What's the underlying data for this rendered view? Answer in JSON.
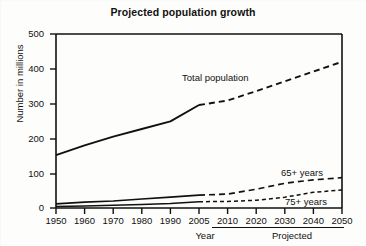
{
  "chart_data": {
    "type": "line",
    "title": "Projected population growth",
    "xlabel": "Year",
    "ylabel": "Number in millions",
    "xlim": [
      1950,
      2050
    ],
    "ylim": [
      0,
      500
    ],
    "grid": false,
    "legend_position": "inline-annotations",
    "xticks": [
      "1950",
      "1960",
      "1970",
      "1980",
      "1990",
      "2005",
      "2010",
      "2020",
      "2030",
      "2040",
      "2050"
    ],
    "xtick_values": [
      1950,
      1960,
      1970,
      1980,
      1990,
      2005,
      2010,
      2020,
      2030,
      2040,
      2050
    ],
    "yticks": [
      "0",
      "100",
      "200",
      "300",
      "400",
      "500"
    ],
    "ytick_values": [
      0,
      100,
      200,
      300,
      400,
      500
    ],
    "projected_from": 2005,
    "projected_note": "Projected",
    "series": [
      {
        "name": "Total population",
        "style_actual": "solid",
        "style_projected": "dashed",
        "x": [
          1950,
          1960,
          1970,
          1980,
          1990,
          2005,
          2010,
          2020,
          2030,
          2040,
          2050
        ],
        "values": [
          152,
          180,
          205,
          227,
          249,
          296,
          309,
          336,
          364,
          392,
          420
        ]
      },
      {
        "name": "65+ years",
        "style_actual": "solid",
        "style_projected": "dashed",
        "x": [
          1950,
          1960,
          1970,
          1980,
          1990,
          2005,
          2010,
          2020,
          2030,
          2040,
          2050
        ],
        "values": [
          12,
          17,
          20,
          26,
          31,
          37,
          40,
          54,
          71,
          81,
          87
        ]
      },
      {
        "name": "75+ years",
        "style_actual": "solid",
        "style_projected": "dashed",
        "x": [
          1950,
          1960,
          1970,
          1980,
          1990,
          2005,
          2010,
          2020,
          2030,
          2040,
          2050
        ],
        "values": [
          4,
          6,
          8,
          10,
          13,
          18,
          19,
          22,
          31,
          45,
          52
        ]
      }
    ],
    "annotations": [
      {
        "text": "Total population",
        "x": 1988,
        "y": 355
      },
      {
        "text": "65+ years",
        "x": 2031,
        "y": 112
      },
      {
        "text": "75+ years",
        "x": 2034,
        "y": 20
      }
    ],
    "colors": {
      "line": "#111111",
      "background": "#fdfdfb",
      "axis": "#111111"
    }
  },
  "axis": {
    "y_title": "Number in millions",
    "x_title": "Year",
    "projected_label": "Projected"
  },
  "title": "Projected population growth"
}
